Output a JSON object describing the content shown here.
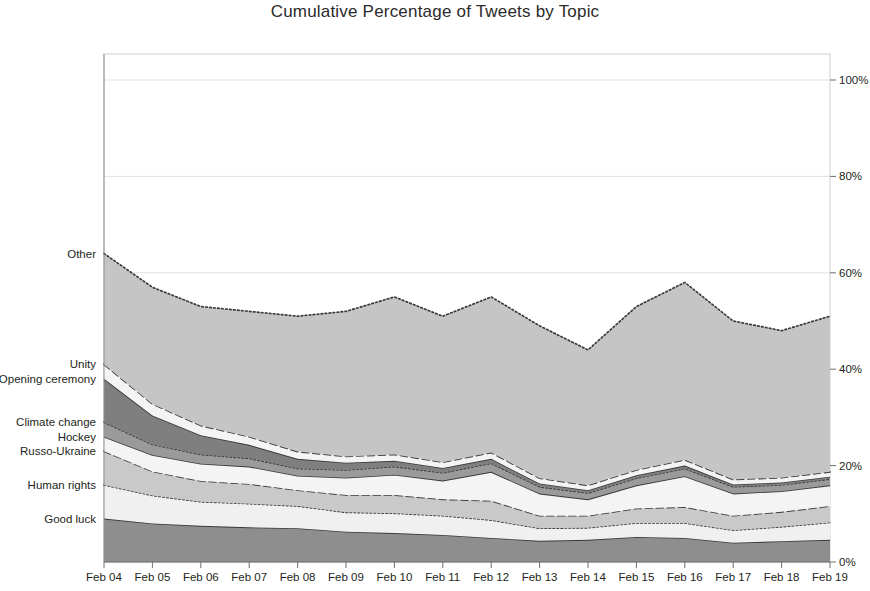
{
  "chart_data": {
    "type": "area",
    "title": "Cumulative Percentage of Tweets by Topic",
    "xlabel": "",
    "ylabel": "",
    "ylim": [
      0,
      100
    ],
    "ytick_labels": [
      "0%",
      "20%",
      "40%",
      "60%",
      "80%",
      "100%"
    ],
    "ytick_values": [
      0,
      20,
      40,
      60,
      80,
      100
    ],
    "grid": true,
    "legend_position": "left-inline",
    "stacked": true,
    "categories": [
      "Feb 04",
      "Feb 05",
      "Feb 06",
      "Feb 07",
      "Feb 08",
      "Feb 09",
      "Feb 10",
      "Feb 11",
      "Feb 12",
      "Feb 13",
      "Feb 14",
      "Feb 15",
      "Feb 16",
      "Feb 17",
      "Feb 18",
      "Feb 19"
    ],
    "series": [
      {
        "name": "Good luck",
        "label_y_percent": 9,
        "fill": "#8e8e8e",
        "stroke": "#3a3a3a",
        "dash": "none",
        "values": [
          9.0,
          8.0,
          7.5,
          7.2,
          7.0,
          6.3,
          6.0,
          5.6,
          5.0,
          4.4,
          4.6,
          5.2,
          5.0,
          4.0,
          4.3,
          4.6
        ]
      },
      {
        "name": "Human rights",
        "label_y_percent": 16,
        "fill": "#f0f0f0",
        "stroke": "#3a3a3a",
        "dash": "dotted",
        "values": [
          7.0,
          5.8,
          5.0,
          4.9,
          4.6,
          4.0,
          4.1,
          4.0,
          3.7,
          2.6,
          2.5,
          2.9,
          3.1,
          2.6,
          3.0,
          3.6
        ]
      },
      {
        "name": "Russo-Ukraine",
        "label_y_percent": 23,
        "fill": "#c9c9c9",
        "stroke": "#3a3a3a",
        "dash": "dashed",
        "values": [
          7.0,
          5.0,
          4.3,
          4.1,
          3.3,
          3.6,
          3.8,
          3.4,
          4.0,
          2.6,
          2.5,
          3.0,
          3.3,
          3.0,
          3.1,
          3.4
        ]
      },
      {
        "name": "Hockey",
        "label_y_percent": 26,
        "fill": "#f4f4f4",
        "stroke": "#3a3a3a",
        "dash": "none",
        "values": [
          3.0,
          3.4,
          3.6,
          3.6,
          3.0,
          3.6,
          4.2,
          3.9,
          6.0,
          4.6,
          3.4,
          4.8,
          6.4,
          4.6,
          4.3,
          4.3
        ]
      },
      {
        "name": "Climate change",
        "label_y_percent": 29,
        "fill": "#9a9a9a",
        "stroke": "#3a3a3a",
        "dash": "dotted",
        "values": [
          3.0,
          2.2,
          1.9,
          1.7,
          1.5,
          1.6,
          1.7,
          1.6,
          1.8,
          1.4,
          1.3,
          1.5,
          1.6,
          1.4,
          1.3,
          1.3
        ]
      },
      {
        "name": "Opening ceremony",
        "label_y_percent": 38,
        "fill": "#7f7f7f",
        "stroke": "#3a3a3a",
        "dash": "none",
        "values": [
          9.0,
          6.0,
          4.0,
          2.8,
          2.0,
          1.5,
          1.2,
          1.0,
          0.9,
          0.7,
          0.6,
          0.6,
          0.6,
          0.5,
          0.5,
          0.5
        ]
      },
      {
        "name": "Unity",
        "label_y_percent": 41,
        "fill": "#f4f4f4",
        "stroke": "#3a3a3a",
        "dash": "dashed",
        "values": [
          3.0,
          2.4,
          2.0,
          1.7,
          1.5,
          1.3,
          1.3,
          1.2,
          1.3,
          1.1,
          1.0,
          1.1,
          1.2,
          1.0,
          1.0,
          1.0
        ]
      },
      {
        "name": "Other",
        "label_y_percent": 64,
        "fill": "#c5c5c5",
        "stroke": "#3a3a3a",
        "dash": "dotted",
        "values": [
          23.0,
          24.2,
          24.7,
          26.0,
          28.1,
          30.1,
          32.7,
          30.3,
          32.3,
          31.6,
          28.1,
          33.9,
          36.8,
          32.9,
          30.5,
          32.3
        ]
      }
    ],
    "series_labels": [
      "Other",
      "Unity",
      "Opening ceremony",
      "Climate change",
      "Hockey",
      "Russo-Ukraine",
      "Human rights",
      "Good luck"
    ]
  },
  "colors": {
    "background": "#ffffff",
    "axis": "#9a9a9a",
    "text": "#231f20",
    "grid": "#e2e2e2"
  }
}
